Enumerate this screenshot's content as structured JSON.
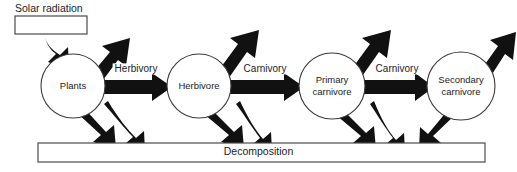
{
  "diagram": {
    "type": "energy-flow",
    "colors": {
      "arrow": "#111111",
      "outline": "#3a3a3a",
      "background": "#ffffff",
      "text": "#1c1c1c"
    },
    "input_box": {
      "label": "Solar radiation",
      "value": ""
    },
    "sink_box": {
      "label": "Decomposition"
    },
    "nodes": [
      {
        "id": "plants",
        "label": "Plants",
        "line1": "Plants",
        "line2": "",
        "cx": 73,
        "cy": 86,
        "r": 32
      },
      {
        "id": "herbivore",
        "label": "Herbivore",
        "line1": "Herbivore",
        "line2": "",
        "cx": 199,
        "cy": 86,
        "r": 32
      },
      {
        "id": "primary-carnivore",
        "label": "Primary carnivore",
        "line1": "Primary",
        "line2": "carnivore",
        "cx": 332,
        "cy": 86,
        "r": 33
      },
      {
        "id": "secondary-carnivore",
        "label": "Secondary carnivore",
        "line1": "Secondary",
        "line2": "carnivore",
        "cx": 461,
        "cy": 86,
        "r": 34
      }
    ],
    "flows": [
      {
        "id": "herbivory",
        "label": "Herbivory",
        "from": "plants",
        "to": "herbivore",
        "x": 136,
        "y": 69
      },
      {
        "id": "carnivory-1",
        "label": "Carnivory",
        "from": "herbivore",
        "to": "primary-carnivore",
        "x": 265,
        "y": 69
      },
      {
        "id": "carnivory-2",
        "label": "Carnivory",
        "from": "primary-carnivore",
        "to": "secondary-carnivore",
        "x": 397,
        "y": 69
      }
    ],
    "heat_loss_arrows": 4,
    "decomposition_arrows": 7
  }
}
